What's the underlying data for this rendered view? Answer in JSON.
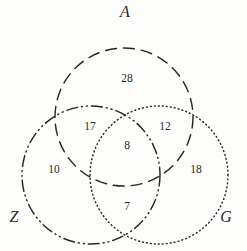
{
  "diagram": {
    "kind": "venn-3-set",
    "background_color": "#fdfdfb",
    "stroke_color": "#272727",
    "width": 247,
    "height": 251
  },
  "sets": [
    {
      "id": "A",
      "label": "A",
      "stroke_style": "dashed",
      "cx": 124,
      "cy": 117,
      "r": 69,
      "label_x": 125,
      "label_y": 17
    },
    {
      "id": "Z",
      "label": "Z",
      "stroke_style": "dash-dot-dot",
      "cx": 91,
      "cy": 175,
      "r": 69,
      "label_x": 14,
      "label_y": 222
    },
    {
      "id": "G",
      "label": "G",
      "stroke_style": "dotted",
      "cx": 159,
      "cy": 175,
      "r": 69,
      "label_x": 226,
      "label_y": 222
    }
  ],
  "regions": [
    {
      "id": "A-only",
      "value": "28",
      "x": 127,
      "y": 82
    },
    {
      "id": "A-and-Z",
      "value": "17",
      "x": 90,
      "y": 130
    },
    {
      "id": "A-and-G",
      "value": "12",
      "x": 165,
      "y": 130
    },
    {
      "id": "A-Z-G",
      "value": "8",
      "x": 127,
      "y": 149
    },
    {
      "id": "Z-only",
      "value": "10",
      "x": 54,
      "y": 173
    },
    {
      "id": "G-only",
      "value": "18",
      "x": 196,
      "y": 173
    },
    {
      "id": "Z-and-G",
      "value": "7",
      "x": 127,
      "y": 210
    }
  ],
  "chart_data": {
    "type": "venn",
    "title": "",
    "set_names": [
      "A",
      "Z",
      "G"
    ],
    "region_values": {
      "A_only": 28,
      "Z_only": 10,
      "G_only": 18,
      "A_and_Z_only": 17,
      "A_and_G_only": 12,
      "Z_and_G_only": 7,
      "A_and_Z_and_G": 8
    },
    "set_totals": {
      "A": 65,
      "Z": 42,
      "G": 45
    },
    "grand_total": 100,
    "legend": "none",
    "grid": false
  }
}
